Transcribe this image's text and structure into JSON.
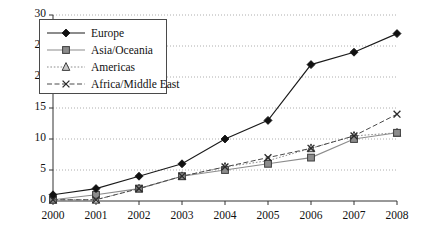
{
  "chart_data": {
    "type": "line",
    "title": "",
    "xlabel": "",
    "ylabel": "",
    "categories": [
      "2000",
      "2001",
      "2002",
      "2003",
      "2004",
      "2005",
      "2006",
      "2007",
      "2008"
    ],
    "x": [
      2000,
      2001,
      2002,
      2003,
      2004,
      2005,
      2006,
      2007,
      2008
    ],
    "xlim": [
      2000,
      2008
    ],
    "ylim": [
      0,
      30
    ],
    "yticks": [
      0,
      5,
      10,
      15,
      20,
      25,
      30
    ],
    "xticks": [
      "2000",
      "2001",
      "2002",
      "2003",
      "2004",
      "2005",
      "2006",
      "2007",
      "2008"
    ],
    "grid": "horizontal-dotted",
    "legend_position": "top-left",
    "series": [
      {
        "name": "Europe",
        "marker": "filled-diamond",
        "line_style": "solid",
        "color": "#1a1a1a",
        "values": [
          1,
          2,
          4,
          6,
          10,
          13,
          22,
          24,
          27
        ]
      },
      {
        "name": "Asia/Oceania",
        "marker": "filled-square",
        "line_style": "solid",
        "color": "#8c8c8c",
        "values": [
          0.2,
          1,
          2,
          4,
          5,
          6,
          7,
          10,
          11
        ]
      },
      {
        "name": "Americas",
        "marker": "open-triangle",
        "line_style": "dotted",
        "color": "#8c8c8c",
        "values": [
          0.2,
          0.2,
          2,
          4,
          5.5,
          6.5,
          8.5,
          10.5,
          11
        ]
      },
      {
        "name": "Africa/Middle East",
        "marker": "cross-x",
        "line_style": "dashed",
        "color": "#4a4a4a",
        "values": [
          0.2,
          0.2,
          2,
          4,
          5.5,
          7,
          8.5,
          10.5,
          14
        ]
      }
    ]
  },
  "legend": {
    "items": [
      {
        "label": "Europe"
      },
      {
        "label": "Asia/Oceania"
      },
      {
        "label": "Americas"
      },
      {
        "label": "Africa/Middle East"
      }
    ]
  }
}
